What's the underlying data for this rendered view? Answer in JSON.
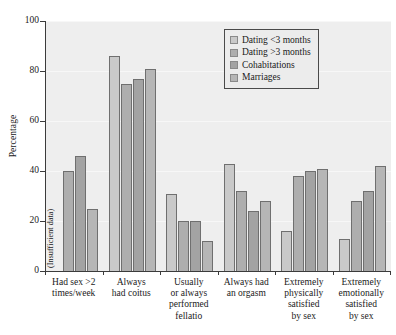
{
  "chart_data": {
    "type": "bar",
    "title": "",
    "xlabel": "",
    "ylabel": "Percentage",
    "ylim": [
      0,
      100
    ],
    "yticks": [
      0,
      20,
      40,
      60,
      80,
      100
    ],
    "grid": true,
    "legend_position": "top-right",
    "categories": [
      "Had sex >2 times/week",
      "Always had coitus",
      "Usually or always performed fellatio",
      "Always had an orgasm",
      "Extremely physically satisfied by sex",
      "Extremely emotionally satisfied by sex"
    ],
    "category_lines": [
      [
        "Had sex >2",
        "times/week"
      ],
      [
        "Always",
        "had coitus"
      ],
      [
        "Usually",
        "or always",
        "performed",
        "fellatio"
      ],
      [
        "Always had",
        "an orgasm"
      ],
      [
        "Extremely",
        "physically",
        "satisfied",
        "by sex"
      ],
      [
        "Extremely",
        "emotionally",
        "satisfied",
        "by sex"
      ]
    ],
    "series": [
      {
        "name": "Dating <3 months",
        "color": "#c9c9c9",
        "values": [
          null,
          86,
          31,
          43,
          16,
          13
        ]
      },
      {
        "name": "Dating >3 months",
        "color": "#aeaeae",
        "values": [
          40,
          75,
          20,
          32,
          38,
          28
        ]
      },
      {
        "name": "Cohabitations",
        "color": "#a3a3a3",
        "values": [
          46,
          77,
          20,
          24,
          40,
          32
        ]
      },
      {
        "name": "Marriages",
        "color": "#b6b6b6",
        "values": [
          25,
          81,
          12,
          28,
          41,
          42
        ]
      }
    ],
    "annotations": [
      {
        "text": "(Insufficient data)",
        "category": "Had sex >2 times/week",
        "series": "Dating <3 months",
        "orientation": "vertical"
      }
    ]
  },
  "colors": {
    "plot_background": "#eeeeee",
    "axis": "#3b3b3b",
    "gridline": "#f7f7f7",
    "bar_outline": "#6f6f6f",
    "legend_background": "#ececec",
    "legend_border": "#4a4a4a",
    "text": "#1a1a1a"
  }
}
